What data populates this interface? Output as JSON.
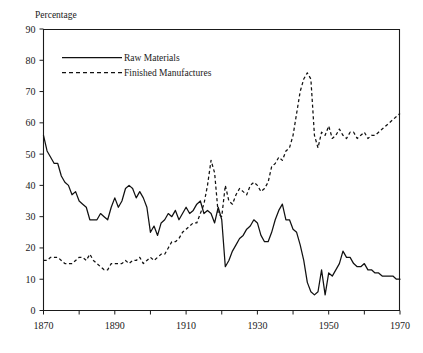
{
  "figure": {
    "ylabel": "Percentage",
    "caption": ""
  },
  "chart_data": {
    "type": "line",
    "title": "",
    "xlabel": "",
    "ylabel": "Percentage",
    "xlim": [
      1870,
      1970
    ],
    "ylim": [
      0,
      90
    ],
    "ytick_values": [
      0,
      10,
      20,
      30,
      40,
      50,
      60,
      70,
      80,
      90
    ],
    "ytick_labels": [
      "0",
      "10",
      "20",
      "30",
      "40",
      "50",
      "60",
      "70",
      "80",
      "90"
    ],
    "xtick_values": [
      1870,
      1890,
      1910,
      1930,
      1950,
      1970
    ],
    "xtick_labels": [
      "1870",
      "1890",
      "1910",
      "1930",
      "1950",
      "1970"
    ],
    "xminor_step": 10,
    "grid": false,
    "legend_position": "upper-left-inside",
    "series": [
      {
        "name": "Raw Materials",
        "style": "solid",
        "color": "#111111",
        "x": [
          1870,
          1871,
          1872,
          1873,
          1874,
          1875,
          1876,
          1877,
          1878,
          1879,
          1880,
          1881,
          1882,
          1883,
          1884,
          1885,
          1886,
          1887,
          1888,
          1889,
          1890,
          1891,
          1892,
          1893,
          1894,
          1895,
          1896,
          1897,
          1898,
          1899,
          1900,
          1901,
          1902,
          1903,
          1904,
          1905,
          1906,
          1907,
          1908,
          1909,
          1910,
          1911,
          1912,
          1913,
          1914,
          1915,
          1916,
          1917,
          1918,
          1919,
          1920,
          1921,
          1922,
          1923,
          1924,
          1925,
          1926,
          1927,
          1928,
          1929,
          1930,
          1931,
          1932,
          1933,
          1934,
          1935,
          1936,
          1937,
          1938,
          1939,
          1940,
          1941,
          1942,
          1943,
          1944,
          1945,
          1946,
          1947,
          1948,
          1949,
          1950,
          1951,
          1952,
          1953,
          1954,
          1955,
          1956,
          1957,
          1958,
          1959,
          1960,
          1961,
          1962,
          1963,
          1964,
          1965,
          1966,
          1967,
          1968,
          1969,
          1970
        ],
        "values": [
          56,
          51,
          49,
          47,
          47,
          43,
          41,
          40,
          37,
          38,
          35,
          34,
          33,
          29,
          29,
          29,
          31,
          30,
          29,
          33,
          36,
          33,
          35,
          39,
          40,
          39,
          36,
          38,
          36,
          33,
          25,
          27,
          24,
          28,
          29,
          31,
          30,
          32,
          29,
          31,
          33,
          31,
          32,
          34,
          35,
          31,
          32,
          31,
          28,
          33,
          29,
          14,
          16,
          19,
          21,
          23,
          24,
          26,
          27,
          29,
          28,
          24,
          22,
          22,
          25,
          29,
          32,
          34,
          29,
          29,
          26,
          25,
          21,
          16,
          9,
          6,
          5,
          6,
          13,
          5,
          12,
          11,
          13,
          15,
          19,
          17,
          17,
          15,
          14,
          14,
          15,
          13,
          13,
          12,
          12,
          11,
          11,
          11,
          11,
          10,
          10
        ]
      },
      {
        "name": "Finished Manufactures",
        "style": "dashed",
        "color": "#111111",
        "x": [
          1870,
          1871,
          1872,
          1873,
          1874,
          1875,
          1876,
          1877,
          1878,
          1879,
          1880,
          1881,
          1882,
          1883,
          1884,
          1885,
          1886,
          1887,
          1888,
          1889,
          1890,
          1891,
          1892,
          1893,
          1894,
          1895,
          1896,
          1897,
          1898,
          1899,
          1900,
          1901,
          1902,
          1903,
          1904,
          1905,
          1906,
          1907,
          1908,
          1909,
          1910,
          1911,
          1912,
          1913,
          1914,
          1915,
          1916,
          1917,
          1918,
          1919,
          1920,
          1921,
          1922,
          1923,
          1924,
          1925,
          1926,
          1927,
          1928,
          1929,
          1930,
          1931,
          1932,
          1933,
          1934,
          1935,
          1936,
          1937,
          1938,
          1939,
          1940,
          1941,
          1942,
          1943,
          1944,
          1945,
          1946,
          1947,
          1948,
          1949,
          1950,
          1951,
          1952,
          1953,
          1954,
          1955,
          1956,
          1957,
          1958,
          1959,
          1960,
          1961,
          1962,
          1963,
          1964,
          1965,
          1966,
          1967,
          1968,
          1969,
          1970
        ],
        "values": [
          16,
          16,
          17,
          17,
          17,
          16,
          15,
          15,
          15,
          16,
          17,
          17,
          16,
          18,
          16,
          15,
          14,
          13,
          13,
          15,
          15,
          15,
          15,
          16,
          15,
          16,
          16,
          17,
          15,
          16,
          17,
          16,
          17,
          18,
          18,
          20,
          22,
          22,
          23,
          25,
          26,
          27,
          28,
          28,
          31,
          34,
          40,
          48,
          44,
          31,
          30,
          40,
          35,
          34,
          37,
          39,
          38,
          37,
          40,
          41,
          40,
          38,
          39,
          41,
          46,
          47,
          49,
          48,
          51,
          52,
          56,
          63,
          70,
          74,
          76,
          74,
          56,
          52,
          57,
          56,
          59,
          55,
          56,
          58,
          56,
          55,
          57,
          57,
          55,
          56,
          57,
          55,
          56,
          56,
          57,
          58,
          59,
          60,
          61,
          62,
          63
        ]
      }
    ]
  },
  "legend": {
    "entries": [
      {
        "label": "Raw Materials",
        "style": "solid"
      },
      {
        "label": "Finished Manufactures",
        "style": "dashed"
      }
    ]
  }
}
